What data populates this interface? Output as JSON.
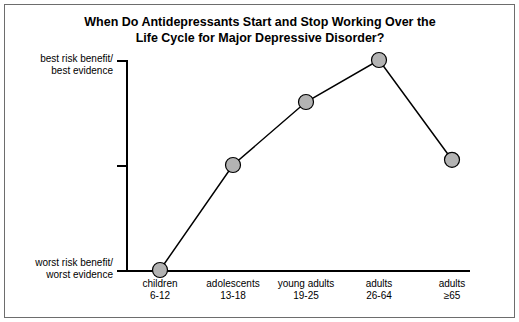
{
  "chart_data": {
    "type": "line",
    "title": "When Do Antidepressants Start and Stop Working Over the Life Cycle for Major Depressive Disorder?",
    "title_line1": "When Do Antidepressants Start and Stop Working Over the",
    "title_line2": "Life Cycle for Major Depressive Disorder?",
    "xlabel": "",
    "ylabel": "",
    "grid": false,
    "legend": "none",
    "categories": [
      "children 6-12",
      "adolescents 13-18",
      "young adults 19-25",
      "adults 26-64",
      "adults ≥65"
    ],
    "category_lines": [
      [
        "children",
        "6-12"
      ],
      [
        "adolescents",
        "13-18"
      ],
      [
        "young adults",
        "19-25"
      ],
      [
        "adults",
        "26-64"
      ],
      [
        "adults",
        "≥65"
      ]
    ],
    "values": [
      0,
      2,
      3.2,
      4,
      2.1
    ],
    "ylim": [
      0,
      4
    ],
    "y_tick_values": [
      0,
      2,
      4
    ],
    "y_tick_labels": [
      [
        "worst risk benefit/",
        "worst evidence"
      ],
      [
        "",
        ""
      ],
      [
        "best risk benefit/",
        "best evidence"
      ]
    ],
    "marker": {
      "shape": "circle",
      "fill": "#b3b3b3",
      "edge": "#000000",
      "size_px": 15
    },
    "line": {
      "color": "#000000",
      "width_px": 1.5
    },
    "axis_color": "#000000",
    "background": "#ffffff",
    "border_color": "#6d6d6d"
  }
}
